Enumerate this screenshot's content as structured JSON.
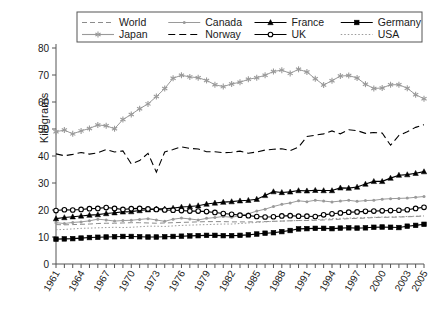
{
  "chart_data": {
    "type": "line",
    "title": "",
    "xlabel": "",
    "ylabel": "Kilograms",
    "xlim": [
      1961,
      2005
    ],
    "ylim": [
      0,
      80
    ],
    "yticks": [
      0,
      10,
      20,
      30,
      40,
      50,
      60,
      70,
      80
    ],
    "xticks": [
      1961,
      1964,
      1967,
      1970,
      1973,
      1976,
      1979,
      1982,
      1985,
      1988,
      1991,
      1994,
      1997,
      2000,
      2003,
      2005
    ],
    "x": [
      1961,
      1962,
      1963,
      1964,
      1965,
      1966,
      1967,
      1968,
      1969,
      1970,
      1971,
      1972,
      1973,
      1974,
      1975,
      1976,
      1977,
      1978,
      1979,
      1980,
      1981,
      1982,
      1983,
      1984,
      1985,
      1986,
      1987,
      1988,
      1989,
      1990,
      1991,
      1992,
      1993,
      1994,
      1995,
      1996,
      1997,
      1998,
      1999,
      2000,
      2001,
      2002,
      2003,
      2004,
      2005
    ],
    "grid": false,
    "legend_position": "top",
    "legend_columns": 4,
    "series": [
      {
        "name": "World",
        "marker": "none",
        "dash": "dashed",
        "color": "#8c8c8c",
        "values": [
          14.6,
          14.5,
          14.6,
          14.7,
          14.8,
          15.0,
          15.1,
          15.1,
          15.2,
          15.3,
          15.3,
          15.2,
          15.1,
          15.2,
          15.3,
          15.4,
          15.5,
          15.6,
          15.7,
          15.7,
          15.7,
          15.6,
          15.6,
          15.6,
          15.6,
          15.7,
          15.8,
          15.9,
          16.0,
          16.1,
          16.1,
          16.2,
          16.3,
          16.4,
          16.6,
          16.8,
          16.9,
          17.0,
          17.2,
          17.3,
          17.3,
          17.4,
          17.5,
          17.6,
          17.8
        ]
      },
      {
        "name": "Canada",
        "marker": "dot",
        "dash": "solid",
        "color": "#9a9a9a",
        "values": [
          15.3,
          15.0,
          15.4,
          15.6,
          16.0,
          16.6,
          16.3,
          15.9,
          16.1,
          16.2,
          16.5,
          16.8,
          16.3,
          15.8,
          16.6,
          17.0,
          16.7,
          16.3,
          16.9,
          17.2,
          17.6,
          17.3,
          17.9,
          18.6,
          19.6,
          20.3,
          21.3,
          22.1,
          22.6,
          23.4,
          23.1,
          23.6,
          23.3,
          23.0,
          23.3,
          23.6,
          23.2,
          23.5,
          23.6,
          24.0,
          24.2,
          24.3,
          24.4,
          24.7,
          25.0
        ]
      },
      {
        "name": "France",
        "marker": "triangle",
        "dash": "solid",
        "color": "#000000",
        "values": [
          16.8,
          17.2,
          17.5,
          17.8,
          18.1,
          18.3,
          18.7,
          19.0,
          19.3,
          19.4,
          19.8,
          20.1,
          20.4,
          20.4,
          20.7,
          21.1,
          21.3,
          21.6,
          22.2,
          22.6,
          22.9,
          23.1,
          23.4,
          23.6,
          24.0,
          25.4,
          26.8,
          26.5,
          26.7,
          27.2,
          27.1,
          27.3,
          27.2,
          27.2,
          28.2,
          28.1,
          28.5,
          29.6,
          30.6,
          30.6,
          31.8,
          32.9,
          33.1,
          33.6,
          34.2
        ]
      },
      {
        "name": "Germany",
        "marker": "square",
        "dash": "solid",
        "color": "#000000",
        "values": [
          9.2,
          9.3,
          9.4,
          9.6,
          9.8,
          9.9,
          10.0,
          10.1,
          10.2,
          10.2,
          10.1,
          10.0,
          10.0,
          10.1,
          10.2,
          10.3,
          10.4,
          10.5,
          10.6,
          10.6,
          10.5,
          10.5,
          10.6,
          10.8,
          11.1,
          11.4,
          11.6,
          12.0,
          12.4,
          13.0,
          13.1,
          13.2,
          13.2,
          13.1,
          13.3,
          13.4,
          13.3,
          13.4,
          13.6,
          13.7,
          13.6,
          13.5,
          14.0,
          14.3,
          14.7
        ]
      },
      {
        "name": "Japan",
        "marker": "asterisk",
        "dash": "solid",
        "color": "#9a9a9a",
        "values": [
          49.0,
          49.6,
          48.2,
          49.3,
          50.2,
          51.5,
          51.2,
          50.1,
          53.5,
          55.4,
          57.5,
          59.3,
          62.0,
          65.0,
          68.8,
          69.9,
          69.3,
          69.0,
          68.0,
          66.4,
          65.7,
          66.7,
          67.3,
          68.4,
          69.0,
          69.9,
          71.3,
          71.8,
          70.6,
          72.1,
          71.1,
          68.6,
          66.3,
          67.9,
          69.6,
          69.8,
          68.9,
          66.6,
          65.0,
          65.2,
          66.4,
          66.4,
          65.1,
          62.7,
          61.2
        ]
      },
      {
        "name": "Norway",
        "marker": "none",
        "dash": "longdash",
        "color": "#000000",
        "values": [
          40.8,
          40.1,
          40.6,
          41.3,
          40.7,
          41.2,
          42.4,
          41.5,
          41.9,
          37.1,
          38.3,
          41.0,
          34.0,
          41.5,
          42.4,
          43.4,
          42.8,
          42.6,
          41.6,
          41.6,
          41.2,
          41.4,
          41.8,
          41.0,
          41.5,
          42.2,
          42.5,
          42.7,
          42.0,
          43.3,
          47.2,
          47.7,
          48.2,
          49.3,
          48.2,
          49.7,
          49.4,
          48.4,
          48.7,
          48.5,
          44.0,
          47.6,
          49.0,
          50.6,
          51.6
        ]
      },
      {
        "name": "UK",
        "marker": "circle",
        "dash": "solid",
        "color": "#000000",
        "values": [
          19.8,
          20.1,
          20.0,
          20.2,
          20.5,
          20.6,
          20.9,
          20.6,
          20.2,
          20.5,
          20.6,
          20.4,
          20.2,
          20.0,
          19.9,
          19.8,
          19.6,
          19.6,
          19.4,
          19.1,
          18.7,
          18.4,
          18.1,
          17.9,
          17.6,
          17.4,
          17.5,
          17.8,
          17.9,
          17.7,
          17.7,
          17.6,
          18.2,
          18.6,
          18.9,
          19.2,
          19.3,
          19.5,
          19.6,
          19.7,
          19.8,
          19.9,
          20.1,
          20.6,
          21.0
        ]
      },
      {
        "name": "USA",
        "marker": "none",
        "dash": "dotted",
        "color": "#9a9a9a",
        "values": [
          12.7,
          12.8,
          13.0,
          13.2,
          13.3,
          13.4,
          13.5,
          13.6,
          13.5,
          13.6,
          13.8,
          14.0,
          14.0,
          13.9,
          14.1,
          14.3,
          14.4,
          14.5,
          14.6,
          14.7,
          14.8,
          14.8,
          15.0,
          15.2,
          15.4,
          15.6,
          15.8,
          15.9,
          16.0,
          16.1,
          16.2,
          16.4,
          16.6,
          16.8,
          16.9,
          17.0,
          17.1,
          17.2,
          17.3,
          17.4,
          17.4,
          17.5,
          17.6,
          17.7,
          17.8
        ]
      }
    ],
    "legend_entries": [
      {
        "label": "World",
        "style": "dashed-gray"
      },
      {
        "label": "Canada",
        "style": "solid-gray-dot"
      },
      {
        "label": "France",
        "style": "solid-black-triangle"
      },
      {
        "label": "Germany",
        "style": "solid-black-square"
      },
      {
        "label": "Japan",
        "style": "solid-gray-asterisk"
      },
      {
        "label": "Norway",
        "style": "longdash-black"
      },
      {
        "label": "UK",
        "style": "solid-black-circle"
      },
      {
        "label": "USA",
        "style": "dotted-gray"
      }
    ]
  }
}
